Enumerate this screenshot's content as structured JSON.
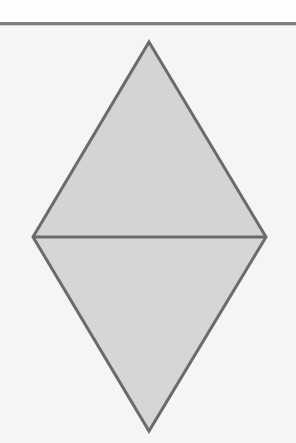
{
  "canvas": {
    "width": 296,
    "height": 443,
    "background_color": "#f5f5f5",
    "above_rule_color": "#fdfdfd"
  },
  "separator": {
    "name": "horizontal-rule",
    "y": 22,
    "thickness": 3,
    "color": "#7d7d7d",
    "shadow_color": "#cfcfcf"
  },
  "figure": {
    "title": "",
    "shape_type": "rhombus",
    "stroke_color": "#6b6b6b",
    "stroke_width": 3,
    "fill_color_upper": "#d4d4d4",
    "fill_color_lower": "#d6d6d6",
    "vertices": {
      "top": {
        "label": "top-apex",
        "x": 149,
        "y": 42
      },
      "left": {
        "label": "left-vertex",
        "x": 33,
        "y": 237
      },
      "right": {
        "label": "right-vertex",
        "x": 266,
        "y": 237
      },
      "bottom": {
        "label": "bottom-apex",
        "x": 149,
        "y": 431
      }
    },
    "upper_triangle_points": "149,42 266,237 33,237",
    "lower_triangle_points": "33,237 266,237 149,431",
    "diagonal_points": "33,237 266,237",
    "outline_points": "149,42 266,237 149,431 33,237"
  },
  "labels": []
}
